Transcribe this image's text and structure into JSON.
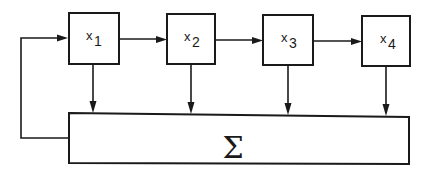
{
  "diagram": {
    "title": "",
    "nodes": [
      {
        "id": "x1",
        "var": "x",
        "sub": "1"
      },
      {
        "id": "x2",
        "var": "x",
        "sub": "2"
      },
      {
        "id": "x3",
        "var": "x",
        "sub": "3"
      },
      {
        "id": "x4",
        "var": "x",
        "sub": "4"
      }
    ],
    "sum": {
      "id": "sum",
      "symbol": "Σ"
    },
    "edges": [
      {
        "from": "x1",
        "to": "x2"
      },
      {
        "from": "x2",
        "to": "x3"
      },
      {
        "from": "x3",
        "to": "x4"
      },
      {
        "from": "x1",
        "to": "sum"
      },
      {
        "from": "x2",
        "to": "sum"
      },
      {
        "from": "x3",
        "to": "sum"
      },
      {
        "from": "x4",
        "to": "sum"
      },
      {
        "from": "sum",
        "to": "x1",
        "type": "feedback"
      }
    ],
    "colors": {
      "stroke": "#1a1a1a",
      "background": "#ffffff"
    }
  }
}
